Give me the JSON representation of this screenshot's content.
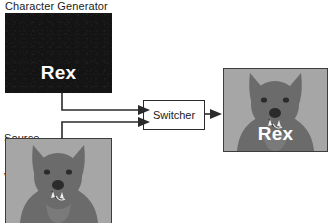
{
  "diagram": {
    "title_visible": false,
    "nodes": {
      "character_generator": {
        "label": "Character Generator",
        "screen_text": "Rex",
        "screen_bg_color": "#141414",
        "screen_text_color": "#ffffff"
      },
      "source_vcr": {
        "label": "Source\nVCR",
        "label_line1": "Source",
        "label_line2": "VCR",
        "image_subject": "dog",
        "image_bg_color": "#a6a6a6",
        "image_subject_color": "#6b6b6b"
      },
      "switcher": {
        "label": "Switcher",
        "border_color": "#2b2b2b",
        "fill_color": "#ffffff"
      },
      "program_output": {
        "overlay_text": "Rex",
        "overlay_text_color": "#ffffff",
        "image_subject": "dog",
        "image_bg_color": "#a6a6a6",
        "image_subject_color": "#6b6b6b"
      }
    },
    "connections": [
      {
        "from": "character_generator",
        "to": "switcher",
        "arrow": "right"
      },
      {
        "from": "source_vcr",
        "to": "switcher",
        "arrow": "right"
      },
      {
        "from": "switcher",
        "to": "program_output",
        "arrow": "right"
      }
    ],
    "line_color": "#2b2b2b"
  }
}
